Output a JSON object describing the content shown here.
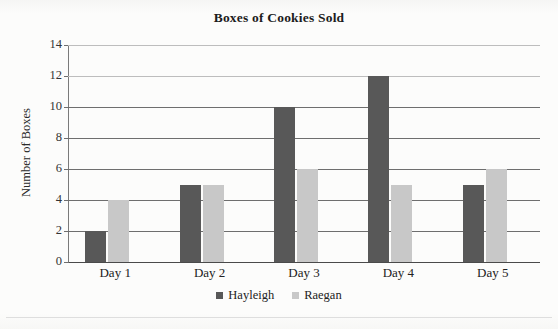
{
  "chart_data": {
    "type": "bar",
    "title": "Boxes of Cookies Sold",
    "xlabel": "",
    "ylabel": "Number of Boxes",
    "categories": [
      "Day 1",
      "Day 2",
      "Day 3",
      "Day 4",
      "Day 5"
    ],
    "series": [
      {
        "name": "Hayleigh",
        "color": "#585858",
        "values": [
          2,
          5,
          10,
          12,
          5
        ]
      },
      {
        "name": "Raegan",
        "color": "#c8c8c8",
        "values": [
          4,
          5,
          6,
          5,
          6
        ]
      }
    ],
    "ylim": [
      0,
      14
    ],
    "ytick_labels": [
      "0",
      "2",
      "4",
      "6",
      "8",
      "10",
      "12",
      "14"
    ],
    "ytick_values": [
      0,
      2,
      4,
      6,
      8,
      10,
      12,
      14
    ],
    "grid": true,
    "grid_axis": "y",
    "legend_position": "bottom",
    "legend_entries": [
      "Hayleigh",
      "Raegan"
    ],
    "background_color": "#fcfcfb",
    "axis_color": "#4a4a4a",
    "gridline_color": "#6e6e6e"
  }
}
